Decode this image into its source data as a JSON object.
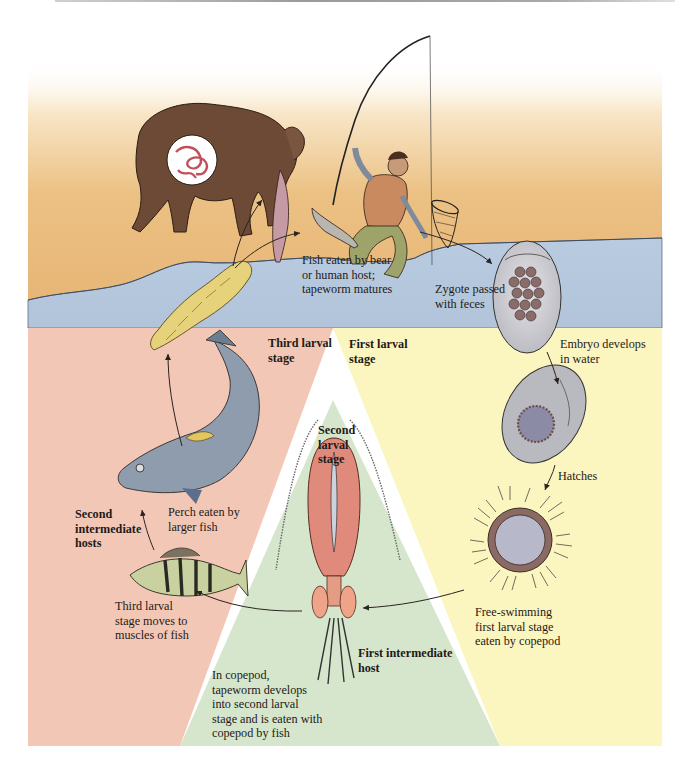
{
  "figure": {
    "regions": [
      {
        "name": "land",
        "color": "#e8b878"
      },
      {
        "name": "water",
        "color": "#b4c6da"
      },
      {
        "name": "third-larval-region",
        "color": "#f3c7b6"
      },
      {
        "name": "second-larval-region",
        "color": "#d5e6cc"
      },
      {
        "name": "first-larval-region",
        "color": "#fbf5bf"
      }
    ],
    "stage_labels": {
      "third_larval": "Third larval\nstage",
      "first_larval": "First larval\nstage",
      "second_larval": "Second\nlarval\nstage",
      "second_intermediate": "Second\nintermediate\nhosts",
      "first_intermediate": "First intermediate\nhost"
    },
    "step_captions": {
      "fish_eaten": "Fish eaten by bear\nor human host;\ntapeworm matures",
      "zygote": "Zygote passed\nwith feces",
      "embryo": "Embryo develops\nin water",
      "hatches": "Hatches",
      "free_swimming": "Free-swimming\nfirst larval stage\neaten by copepod",
      "in_copepod": "In copepod,\ntapeworm develops\ninto second larval\nstage and is eaten with\ncopepod by fish",
      "muscles": "Third larval\nstage moves to\nmuscles of fish",
      "perch_eaten": "Perch eaten by\nlarger fish"
    },
    "illustrations": [
      "bear-with-fish-and-tapeworm-inset",
      "fisherman-with-rod-and-net",
      "caught-fish",
      "plerocercoid-larva",
      "zygote-egg",
      "embryo-egg",
      "coracidium-larva",
      "copepod",
      "perch",
      "large-trout"
    ]
  }
}
